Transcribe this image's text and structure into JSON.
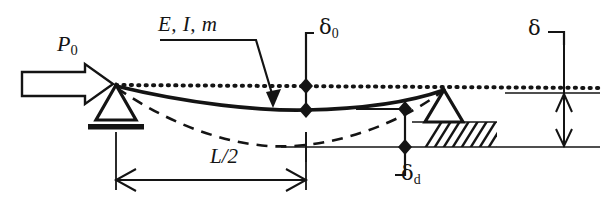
{
  "figure": {
    "type": "engineering-schematic",
    "background_color": "#ffffff",
    "line_color": "#141414",
    "width": 610,
    "height": 214
  },
  "labels": {
    "applied_load": {
      "symbol": "P",
      "subscript": "0",
      "text": "P0"
    },
    "beam_properties": {
      "text": "E, I, m"
    },
    "midspan_initial_deflection": {
      "symbol": "δ",
      "subscript": "0",
      "text": "δ0"
    },
    "end_displacement": {
      "symbol": "δ",
      "subscript": "",
      "text": "δ"
    },
    "dynamic_deflection": {
      "symbol": "δ",
      "subscript": "d",
      "text": "δd"
    },
    "half_span": {
      "text": "L/2"
    }
  },
  "elements": {
    "load_arrow": {
      "name": "block-arrow-right",
      "interactable": false
    },
    "left_support": {
      "name": "pin-support-triangle",
      "interactable": false
    },
    "right_support": {
      "name": "pin-support-triangle-hatched",
      "interactable": false
    },
    "reference_line": {
      "name": "dotted-reference-line",
      "style": "dotted"
    },
    "beam_curve": {
      "name": "deformed-beam-solid",
      "style": "solid"
    },
    "dashed_curve": {
      "name": "deflected-shape-dashed",
      "style": "dashed"
    },
    "ground_line": {
      "name": "baseline",
      "style": "solid"
    },
    "dimension_L2": {
      "name": "dimension-arrow-horizontal",
      "style": "double-headed"
    },
    "dimension_delta": {
      "name": "dimension-arrow-vertical",
      "style": "double-headed"
    },
    "nodes": {
      "name": "diamond-node-marker",
      "count": 6
    }
  }
}
